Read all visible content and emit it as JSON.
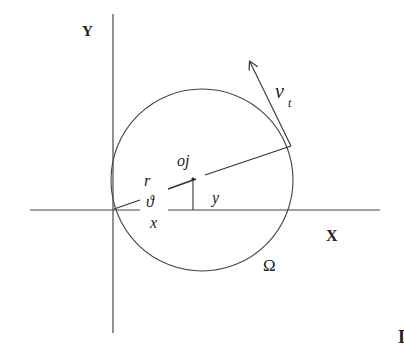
{
  "diagram": {
    "axes": {
      "y_label": "Y",
      "x_label": "X"
    },
    "labels": {
      "tangent_velocity": "v",
      "tangent_velocity_sub": "t",
      "point": "oj",
      "radius": "r",
      "angle": "ϑ",
      "x_coord": "x",
      "y_coord": "y",
      "region": "Ω",
      "edge_mark": "I"
    },
    "colors": {
      "stroke": "#333333",
      "text": "#222222",
      "background": "#ffffff"
    }
  }
}
